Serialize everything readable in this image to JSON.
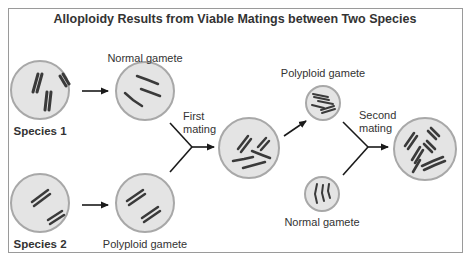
{
  "title": "Alloploidy Results from Viable Matings between Two Species",
  "labels": {
    "species1": "Species 1",
    "species2": "Species 2",
    "normal_gamete_top": "Normal gamete",
    "polyploid_gamete_bottom": "Polyploid gamete",
    "first_mating_line1": "First",
    "first_mating_line2": "mating",
    "polyploid_gamete_right": "Polyploid gamete",
    "normal_gamete_right": "Normal gamete",
    "second_mating_line1": "Second",
    "second_mating_line2": "mating"
  },
  "colors": {
    "cell_fill": "#e4e4e4",
    "cell_stroke": "#a8a8a8",
    "chromosome": "#3a3a3a",
    "arrow": "#1a1a1a",
    "border": "#9a9a9a",
    "text": "#333333"
  }
}
